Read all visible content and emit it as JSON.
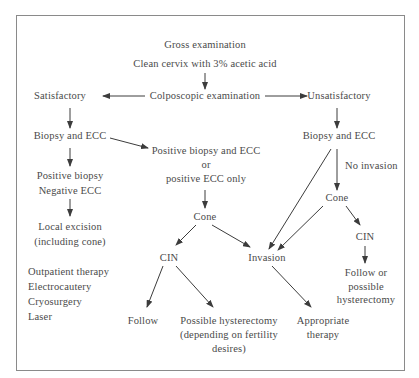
{
  "diagram": {
    "nodes": {
      "gross": "Gross examination",
      "clean": "Clean cervix with 3% acetic acid",
      "colposcopic": "Colposcopic examination",
      "satisfactory": "Satisfactory",
      "unsatisfactory": "Unsatisfactory",
      "biopsy_left": "Biopsy and ECC",
      "biopsy_right": "Biopsy and ECC",
      "positive_both": [
        "Positive biopsy and ECC",
        "or",
        "positive ECC only"
      ],
      "no_invasion": "No invasion",
      "pos_neg": [
        "Positive biopsy",
        "Negative ECC"
      ],
      "cone_mid": "Cone",
      "cone_right": "Cone",
      "local_excision": [
        "Local excision",
        "(including cone)"
      ],
      "cin_mid": "CIN",
      "invasion": "Invasion",
      "cin_right": "CIN",
      "outpatient_list": [
        "Outpatient therapy",
        "Electrocautery",
        "Cryosurgery",
        "Laser"
      ],
      "follow": "Follow",
      "possible_hysterectomy": [
        "Possible hysterectomy",
        "(depending on fertility",
        "desires)"
      ],
      "appropriate_therapy": [
        "Appropriate",
        "therapy"
      ],
      "follow_or_hysterectomy": [
        "Follow or",
        "possible",
        "hysterectomy"
      ]
    },
    "edges": [
      [
        "clean",
        "colposcopic"
      ],
      [
        "colposcopic",
        "satisfactory"
      ],
      [
        "colposcopic",
        "unsatisfactory"
      ],
      [
        "satisfactory",
        "biopsy_left"
      ],
      [
        "biopsy_left",
        "positive_both"
      ],
      [
        "biopsy_left",
        "pos_neg"
      ],
      [
        "pos_neg",
        "local_excision"
      ],
      [
        "positive_both",
        "cone_mid"
      ],
      [
        "cone_mid",
        "cin_mid"
      ],
      [
        "cone_mid",
        "invasion"
      ],
      [
        "cin_mid",
        "follow"
      ],
      [
        "cin_mid",
        "possible_hysterectomy"
      ],
      [
        "invasion",
        "appropriate_therapy"
      ],
      [
        "unsatisfactory",
        "biopsy_right"
      ],
      [
        "biopsy_right",
        "cone_right"
      ],
      [
        "biopsy_right",
        "invasion"
      ],
      [
        "cone_right",
        "invasion"
      ],
      [
        "cone_right",
        "cin_right"
      ],
      [
        "cin_right",
        "follow_or_hysterectomy"
      ]
    ],
    "colors": {
      "text": "#4a4a4a",
      "lines": "#3c3c3c",
      "frame": "#8a8a8a"
    }
  }
}
